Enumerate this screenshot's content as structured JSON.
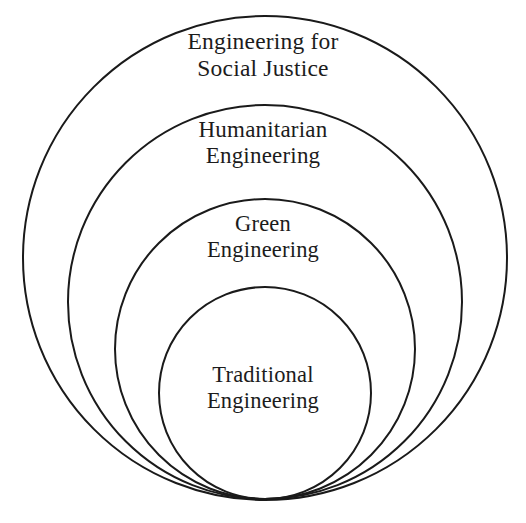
{
  "diagram": {
    "type": "nested-circles-onion",
    "background_color": "#ffffff",
    "stroke_color": "#1a1a1a",
    "text_color": "#1c1c1c",
    "alignment": "bottom-tangent",
    "rings": [
      {
        "index": 0,
        "name": "engineering-for-social-justice",
        "line_1": "Engineering for",
        "line_2": "Social Justice",
        "label": "Engineering for Social Justice",
        "cx": 265,
        "cy": 258,
        "r": 242,
        "stroke_width": 2.0
      },
      {
        "index": 1,
        "name": "humanitarian-engineering",
        "line_1": "Humanitarian",
        "line_2": "Engineering",
        "label": "Humanitarian Engineering",
        "cx": 265,
        "cy": 302,
        "r": 197,
        "stroke_width": 2.0
      },
      {
        "index": 2,
        "name": "green-engineering",
        "line_1": "Green",
        "line_2": "Engineering",
        "label": "Green Engineering",
        "cx": 265,
        "cy": 349,
        "r": 150,
        "stroke_width": 2.0
      },
      {
        "index": 3,
        "name": "traditional-engineering",
        "line_1": "Traditional",
        "line_2": "Engineering",
        "label": "Traditional Engineering",
        "cx": 265,
        "cy": 393,
        "r": 106,
        "stroke_width": 2.0
      }
    ]
  },
  "chart_data": {
    "type": "nested-set-diagram",
    "title": "",
    "subtitle": "",
    "xlabel": "",
    "ylabel": "",
    "legend": [],
    "grid": false,
    "orientation": "bottom-aligned-concentric",
    "categories": [
      "Engineering for Social Justice",
      "Humanitarian Engineering",
      "Green Engineering",
      "Traditional Engineering"
    ],
    "values": [
      242,
      197,
      150,
      106
    ],
    "value_unit": "circle radius (px)",
    "nesting_order_outer_to_inner": [
      "Engineering for Social Justice",
      "Humanitarian Engineering",
      "Green Engineering",
      "Traditional Engineering"
    ],
    "annotations": [
      "Engineering for Social Justice",
      "Humanitarian Engineering",
      "Green Engineering",
      "Traditional Engineering"
    ]
  }
}
